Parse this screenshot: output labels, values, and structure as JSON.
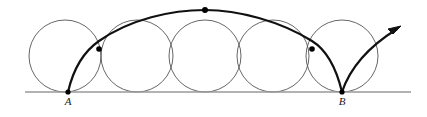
{
  "figure": {
    "canvas": {
      "width": 427,
      "height": 117
    },
    "colors": {
      "baseline": "#999999",
      "circle_stroke": "#555555",
      "curve_stroke": "#111111",
      "point_fill": "#000000",
      "label_color": "#1a1a1a",
      "background": "#ffffff"
    },
    "baseline": {
      "name": "ground-line",
      "x1": 25,
      "y": 92,
      "x2": 411,
      "stroke_width": 1.6
    },
    "circles": {
      "count": 5,
      "radius": 36,
      "center_y": 56,
      "centers_x": [
        65,
        137,
        205,
        273,
        342
      ],
      "stroke_width": 0.9
    },
    "points": [
      {
        "name": "point-a",
        "label": "A",
        "x": 68,
        "y": 92,
        "label_x": 68,
        "label_y": 105,
        "r": 2.6
      },
      {
        "name": "point-b",
        "label": "B",
        "x": 342,
        "y": 92,
        "label_x": 342,
        "label_y": 105,
        "r": 2.6
      },
      {
        "name": "apex-point",
        "label": "",
        "x": 205,
        "y": 10,
        "r": 3.0
      },
      {
        "name": "curve-point-left",
        "label": "",
        "x": 99,
        "y": 49,
        "r": 2.8
      },
      {
        "name": "curve-point-right",
        "label": "",
        "x": 312,
        "y": 49,
        "r": 2.8
      }
    ],
    "curves": [
      {
        "name": "cycloid-arc-main",
        "path": "M 68 92 C 74 66, 86 50, 99 41 C 130 19, 172 10, 205 10 C 238 10, 280 21, 312 41 C 325 49, 336 67, 342 92",
        "stroke_width": 2.2
      },
      {
        "name": "cycloid-arc-outgoing",
        "path": "M 342 92 C 350 68, 368 47, 397 29",
        "stroke_width": 2.2
      }
    ],
    "arrow": {
      "name": "direction-arrowhead",
      "tip_x": 401,
      "tip_y": 26,
      "path": "M 401 26 L 388 29 L 393 34 Z"
    },
    "labels": {
      "a": "A",
      "b": "B"
    }
  }
}
